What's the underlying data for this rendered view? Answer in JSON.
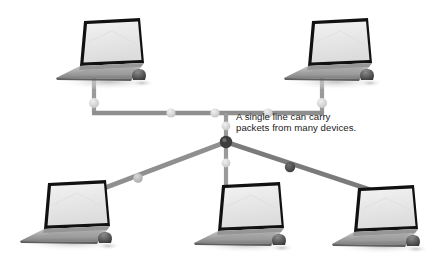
{
  "diagram": {
    "background_color": "#ffffff",
    "annotation": {
      "text": "A single line can carry\npackets from many devices.",
      "color": "#1b1b1b"
    },
    "colors": {
      "line": "#8f8f8f",
      "line_dark": "#6f6f6f",
      "packet_light": "#d4d4d4",
      "packet_mid": "#b5b5b5",
      "packet_dark": "#4a4a4a",
      "hub_node": "#3d3d3d",
      "laptop_bezel": "#111111",
      "laptop_screen": "#e9e9e9",
      "laptop_base": "#a8a8a8",
      "laptop_base_dark": "#6b6b6b",
      "mouse_body": "#4f4f4f",
      "shadow": "#cfcfcf"
    },
    "devices": [
      {
        "id": "laptop-top-left",
        "label": "Laptop top left",
        "x": 56,
        "y": 18,
        "has_mouse": true
      },
      {
        "id": "laptop-top-right",
        "label": "Laptop top right",
        "x": 272,
        "y": 18,
        "has_mouse": true
      },
      {
        "id": "laptop-bottom-left",
        "label": "Laptop bottom left",
        "x": 22,
        "y": 180,
        "has_mouse": true
      },
      {
        "id": "laptop-bottom-center",
        "label": "Laptop bottom center",
        "x": 196,
        "y": 182,
        "has_mouse": true
      },
      {
        "id": "laptop-bottom-right",
        "label": "Laptop bottom right",
        "x": 332,
        "y": 184,
        "has_mouse": true
      }
    ],
    "hub": {
      "id": "hub-node",
      "label": "Shared line junction",
      "x": 226,
      "y": 142
    },
    "links": [
      {
        "id": "link-top-left",
        "from": "laptop-top-left",
        "to": "bus"
      },
      {
        "id": "link-top-right",
        "from": "laptop-top-right",
        "to": "bus"
      },
      {
        "id": "link-bus",
        "from": "bus-left",
        "to": "bus-right"
      },
      {
        "id": "link-hub-riser",
        "from": "bus",
        "to": "hub-node"
      },
      {
        "id": "link-hub-bottom-left",
        "from": "hub-node",
        "to": "laptop-bottom-left"
      },
      {
        "id": "link-hub-bottom-center",
        "from": "hub-node",
        "to": "laptop-bottom-center"
      },
      {
        "id": "link-hub-bottom-right",
        "from": "hub-node",
        "to": "laptop-bottom-right"
      }
    ],
    "packets": [
      {
        "id": "packet-1",
        "x": 94,
        "y": 103,
        "r": 5.0,
        "tone": "light"
      },
      {
        "id": "packet-2",
        "x": 171,
        "y": 113,
        "r": 4.6,
        "tone": "light"
      },
      {
        "id": "packet-3",
        "x": 215,
        "y": 113,
        "r": 4.6,
        "tone": "light"
      },
      {
        "id": "packet-4",
        "x": 268,
        "y": 113,
        "r": 4.6,
        "tone": "light"
      },
      {
        "id": "packet-5",
        "x": 322,
        "y": 103,
        "r": 5.0,
        "tone": "light"
      },
      {
        "id": "packet-6",
        "x": 226,
        "y": 126,
        "r": 4.4,
        "tone": "light"
      },
      {
        "id": "packet-7",
        "x": 226,
        "y": 163,
        "r": 4.4,
        "tone": "light"
      },
      {
        "id": "packet-8",
        "x": 138,
        "y": 178,
        "r": 4.8,
        "tone": "mid"
      },
      {
        "id": "packet-9",
        "x": 290,
        "y": 167,
        "r": 5.2,
        "tone": "dark"
      }
    ]
  }
}
